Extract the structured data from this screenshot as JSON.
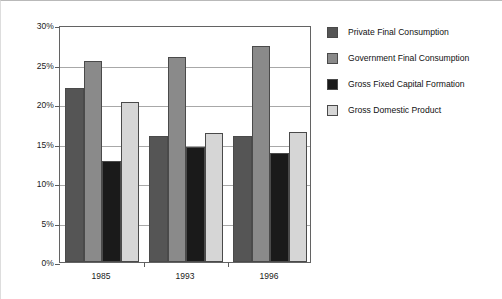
{
  "chart_data": {
    "type": "bar",
    "title": "",
    "subtitle": "",
    "xlabel": "",
    "ylabel": "",
    "categories": [
      "1985",
      "1993",
      "1996"
    ],
    "series": [
      {
        "name": "Private Final Consumption",
        "color": "#555555",
        "values": [
          22.0,
          16.0,
          16.0
        ]
      },
      {
        "name": "Government Final Consumption",
        "color": "#8a8a8a",
        "values": [
          25.4,
          26.0,
          27.3
        ]
      },
      {
        "name": "Gross Fixed Capital Formation",
        "color": "#1a1a1a",
        "values": [
          12.8,
          14.5,
          13.8
        ]
      },
      {
        "name": "Gross Domestic Product",
        "color": "#d6d6d6",
        "values": [
          20.2,
          16.3,
          16.5
        ]
      }
    ],
    "ylim": [
      0,
      30
    ],
    "yticks": [
      0,
      5,
      10,
      15,
      20,
      25,
      30
    ],
    "ytick_labels": [
      "0%",
      "5%",
      "10%",
      "15%",
      "20%",
      "25%",
      "30%"
    ],
    "grid": true,
    "legend_position": "right",
    "value_format": "percent"
  }
}
